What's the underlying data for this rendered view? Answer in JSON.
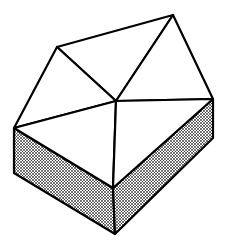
{
  "diagram": {
    "title": "",
    "colors": {
      "background": "#ffffff",
      "stroke": "#000000",
      "top_fill": "#ffffff",
      "side_hatch": "#000000"
    },
    "vertices": {
      "top_left_peak": [
        57,
        47
      ],
      "top_right_peak": [
        173,
        15
      ],
      "center": [
        116,
        101
      ],
      "right_corner": [
        213,
        99
      ],
      "left_corner": [
        14,
        128
      ],
      "front_top": [
        113,
        188
      ],
      "left_bottom": [
        14,
        173
      ],
      "front_bottom": [
        115,
        234
      ],
      "right_bottom": [
        213,
        138
      ]
    },
    "faces": [
      {
        "name": "top-triangle-back",
        "points": [
          "top_left_peak",
          "top_right_peak",
          "center"
        ]
      },
      {
        "name": "top-triangle-left",
        "points": [
          "top_left_peak",
          "center",
          "left_corner"
        ]
      },
      {
        "name": "top-triangle-right",
        "points": [
          "top_right_peak",
          "right_corner",
          "center"
        ]
      },
      {
        "name": "top-triangle-front-left",
        "points": [
          "left_corner",
          "center",
          "front_top"
        ]
      },
      {
        "name": "top-triangle-front-right",
        "points": [
          "center",
          "right_corner",
          "front_top"
        ]
      },
      {
        "name": "side-face-left",
        "points": [
          "left_corner",
          "front_top",
          "front_bottom",
          "left_bottom"
        ],
        "shaded": true
      },
      {
        "name": "side-face-right",
        "points": [
          "front_top",
          "right_corner",
          "right_bottom",
          "front_bottom"
        ],
        "shaded": true
      }
    ]
  }
}
